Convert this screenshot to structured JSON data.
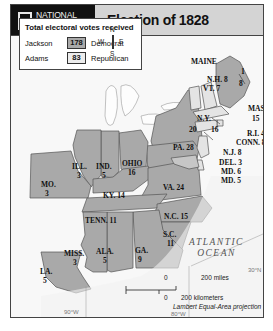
{
  "header": {
    "publisher_line1": "NATIONAL",
    "publisher_line2": "GEOGRAPHIC",
    "title": "Election of 1828"
  },
  "legend": {
    "title": "Total electoral votes received",
    "rows": [
      {
        "candidate": "Jackson",
        "votes": "178",
        "party": "Democrat",
        "fill": "#a9a9a9"
      },
      {
        "candidate": "Adams",
        "votes": "83",
        "party": "Republican",
        "fill": "#eaeaea"
      }
    ]
  },
  "compass": {
    "n": "N",
    "s": "S",
    "e": "E",
    "w": "W"
  },
  "states": [
    {
      "name": "MAINE",
      "votes": "1",
      "votes2": "8",
      "label": "MAINE"
    },
    {
      "name": "N.H.",
      "label": "N.H. 8"
    },
    {
      "name": "VT.",
      "label": "VT. 7"
    },
    {
      "name": "MASS.",
      "label": "MASS.",
      "votes": "15"
    },
    {
      "name": "R.I.",
      "label": "R.I. 4"
    },
    {
      "name": "CONN.",
      "label": "CONN. 8"
    },
    {
      "name": "N.Y.",
      "label": "N.Y.",
      "votes": "20",
      "votes2": "16"
    },
    {
      "name": "N.J.",
      "label": "N.J. 8"
    },
    {
      "name": "DEL.",
      "label": "DEL. 3"
    },
    {
      "name": "MD.",
      "label": "MD. 6"
    },
    {
      "name": "MD.",
      "label": "MD. 5"
    },
    {
      "name": "PA.",
      "label": "PA. 28"
    },
    {
      "name": "VA.",
      "label": "VA. 24"
    },
    {
      "name": "N.C.",
      "label": "N.C. 15"
    },
    {
      "name": "S.C.",
      "label": "S.C.",
      "votes": "11"
    },
    {
      "name": "GA.",
      "label": "GA.",
      "votes": "9"
    },
    {
      "name": "ALA.",
      "label": "ALA.",
      "votes": "5"
    },
    {
      "name": "MISS.",
      "label": "MISS.",
      "votes": "3"
    },
    {
      "name": "LA.",
      "label": "LA.",
      "votes": "5"
    },
    {
      "name": "TENN.",
      "label": "TENN. 11"
    },
    {
      "name": "KY.",
      "label": "KY. 14"
    },
    {
      "name": "OHIO",
      "label": "OHIO",
      "votes": "16"
    },
    {
      "name": "IND.",
      "label": "IND.",
      "votes": "5"
    },
    {
      "name": "ILL.",
      "label": "ILL.",
      "votes": "3"
    },
    {
      "name": "MO.",
      "label": "MO.",
      "votes": "3"
    }
  ],
  "ocean": {
    "line1": "ATLANTIC",
    "line2": "OCEAN"
  },
  "scale": {
    "miles_zero": "0",
    "miles": "200 miles",
    "km_zero": "0",
    "km": "200 kilometers"
  },
  "projection": "Lambert Equal-Area projection",
  "grid": {
    "lon_90": "90°W",
    "lon_80": "80°W",
    "lat_30": "30°N"
  },
  "colors": {
    "jackson": "#a9a9a9",
    "adams": "#e6e6e6",
    "water": "#f4f4f4",
    "land_other": "#fafafa"
  }
}
